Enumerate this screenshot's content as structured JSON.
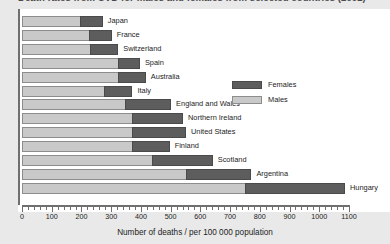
{
  "title": "Death rates from CVD for males and females from selected countries (2002)",
  "axis_label": "Number of deaths / per 100 000 population",
  "legend": {
    "females": "Females",
    "males": "Males"
  },
  "colors": {
    "females": "#5d5d5d",
    "males": "#c9c9c9",
    "axis": "#6f6f6f",
    "page_bg": "#e9e9e9",
    "plot_bg": "#ffffff"
  },
  "chart_data": {
    "type": "bar",
    "orientation": "horizontal",
    "stacked": true,
    "title": "Death rates from CVD for males and females from selected countries (2002)",
    "xlabel": "Number of deaths / per 100 000 population",
    "ylabel": "",
    "xlim": [
      0,
      1100
    ],
    "xticks": [
      0,
      100,
      200,
      300,
      400,
      500,
      600,
      700,
      800,
      900,
      1000,
      1100
    ],
    "minor_tick_step": 20,
    "grid": false,
    "legend_position": "inside-right",
    "categories": [
      "Japan",
      "France",
      "Switzerland",
      "Spain",
      "Australia",
      "Italy",
      "England and Wales",
      "Northern Ireland",
      "United States",
      "Finland",
      "Scotland",
      "Argentina",
      "Hungary"
    ],
    "series": [
      {
        "name": "Males",
        "values": [
          200,
          230,
          232,
          325,
          325,
          280,
          350,
          375,
          375,
          375,
          440,
          555,
          755
        ]
      },
      {
        "name": "Females",
        "values": [
          75,
          75,
          95,
          75,
          95,
          95,
          155,
          170,
          180,
          125,
          205,
          220,
          335
        ]
      }
    ],
    "totals": [
      275,
      305,
      327,
      400,
      420,
      375,
      505,
      545,
      555,
      500,
      645,
      775,
      1090
    ]
  }
}
